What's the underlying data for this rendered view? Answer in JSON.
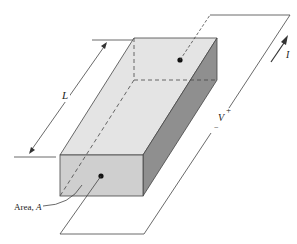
{
  "diagram": {
    "labels": {
      "length": "L",
      "current": "I",
      "voltage": "V",
      "plus": "+",
      "minus": "−",
      "area_prefix": "Area, ",
      "area_symbol": "A"
    },
    "colors": {
      "top_face": "#e4e4e4",
      "front_face": "#cfcfcf",
      "side_face": "#8f8f8f",
      "line": "#333333"
    }
  }
}
